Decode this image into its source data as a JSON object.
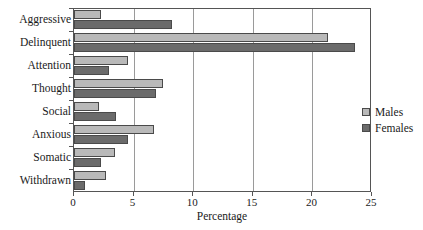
{
  "chart_data": {
    "type": "bar",
    "orientation": "horizontal",
    "title": "",
    "xlabel": "Percentage",
    "ylabel": "",
    "xlim": [
      0,
      25
    ],
    "xticks": [
      0,
      5,
      10,
      15,
      20,
      25
    ],
    "grid": true,
    "legend_position": "right",
    "categories": [
      "Aggressive",
      "Delinquent",
      "Attention",
      "Thought",
      "Social",
      "Anxious",
      "Somatic",
      "Withdrawn"
    ],
    "series": [
      {
        "name": "Males",
        "color": "#b9b9b9",
        "values": [
          2.3,
          21.3,
          4.5,
          7.5,
          2.1,
          6.7,
          3.4,
          2.7
        ]
      },
      {
        "name": "Females",
        "color": "#6b6b6b",
        "values": [
          8.2,
          23.6,
          2.9,
          6.9,
          3.5,
          4.5,
          2.3,
          0.9
        ]
      }
    ]
  },
  "axis": {
    "x_title": "Percentage",
    "tick_labels": [
      "0",
      "5",
      "10",
      "15",
      "20",
      "25"
    ]
  },
  "legend": {
    "items": [
      {
        "label": "Males"
      },
      {
        "label": "Females"
      }
    ]
  }
}
